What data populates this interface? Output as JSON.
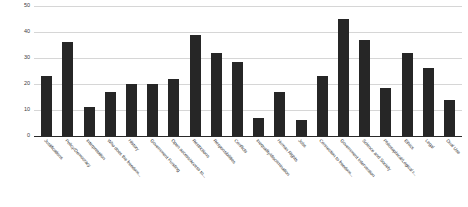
{
  "chart_data": {
    "type": "bar",
    "title": "",
    "subtitle": "",
    "xlabel": "",
    "ylabel": "",
    "ylim": [
      0,
      50
    ],
    "yticks": [
      0,
      10,
      20,
      30,
      40,
      50
    ],
    "grid": true,
    "legend": false,
    "legend_position": "none",
    "bar_color": "#262626",
    "gridline_color": "#d6d6d6",
    "axis_color": "#2a2a2a",
    "categories": [
      "Justifications",
      "Policy/Democracy",
      "Interpretation",
      "Who does the freedom...",
      "History",
      "Government Funding",
      "Open access/access to...",
      "Restrictions",
      "Responsibilities",
      "Conflicts",
      "Inequality/discrimination",
      "Human Rights",
      "Jobs",
      "Connection to freedom...",
      "Government Intervention",
      "Science and Society",
      "Philosophical/Logical r...",
      "Ethics",
      "Legal",
      "Dual Use"
    ],
    "values": [
      23,
      36,
      11,
      17,
      20,
      20,
      22,
      39,
      32,
      28.5,
      7,
      17,
      6,
      23,
      45,
      37,
      18.5,
      32,
      26,
      14
    ]
  }
}
